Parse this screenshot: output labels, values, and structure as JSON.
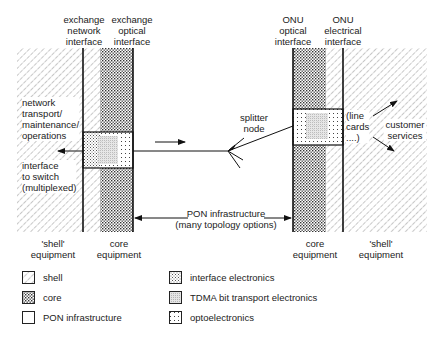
{
  "headers": {
    "exchange_network_interface": [
      "exchange",
      "network",
      "interface"
    ],
    "exchange_optical_interface": [
      "exchange",
      "optical",
      "interface"
    ],
    "onu_optical_interface": [
      "ONU",
      "optical",
      "interface"
    ],
    "onu_electrical_interface": [
      "ONU",
      "electrical",
      "interface"
    ]
  },
  "left_labels": {
    "network_ops": [
      "network",
      "transport/",
      "maintenance/",
      "operations"
    ],
    "interface_switch": [
      "interface",
      "to switch",
      "(multiplexed)"
    ]
  },
  "right_labels": {
    "line_cards": [
      "(line",
      "cards",
      "....)"
    ],
    "customer_services": [
      "customer",
      "services"
    ]
  },
  "center_labels": {
    "splitter_node": [
      "splitter",
      "node"
    ],
    "pon_infrastructure": [
      "PON infrastructure",
      "(many topology options)"
    ]
  },
  "footer_labels": {
    "left_shell": [
      "'shell'",
      "equipment"
    ],
    "left_core": [
      "core",
      "equipment"
    ],
    "right_core": [
      "core",
      "equipment"
    ],
    "right_shell": [
      "'shell'",
      "equipment"
    ]
  },
  "legend": [
    {
      "key": "shell",
      "label": "shell"
    },
    {
      "key": "core",
      "label": "core"
    },
    {
      "key": "pon",
      "label": "PON infrastructure"
    },
    {
      "key": "interface",
      "label": "interface electronics"
    },
    {
      "key": "tdma",
      "label": "TDMA bit transport electronics"
    },
    {
      "key": "opto",
      "label": "optoelectronics"
    }
  ]
}
